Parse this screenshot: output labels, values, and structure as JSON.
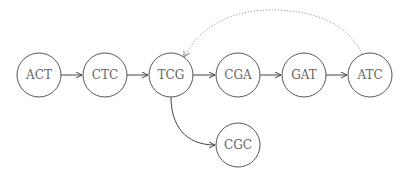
{
  "diagram": {
    "type": "directed-graph",
    "nodes": [
      {
        "id": "n1",
        "label": "ACT",
        "cx": 39,
        "cy": 75
      },
      {
        "id": "n2",
        "label": "CTC",
        "cx": 105,
        "cy": 75
      },
      {
        "id": "n3",
        "label": "TCG",
        "cx": 171,
        "cy": 75
      },
      {
        "id": "n4",
        "label": "CGA",
        "cx": 238,
        "cy": 75
      },
      {
        "id": "n5",
        "label": "GAT",
        "cx": 304,
        "cy": 75
      },
      {
        "id": "n6",
        "label": "ATC",
        "cx": 370,
        "cy": 75
      },
      {
        "id": "n7",
        "label": "CGC",
        "cx": 238,
        "cy": 145
      }
    ],
    "edges": [
      {
        "from": "ACT",
        "to": "CTC",
        "style": "solid"
      },
      {
        "from": "CTC",
        "to": "TCG",
        "style": "solid"
      },
      {
        "from": "TCG",
        "to": "CGA",
        "style": "solid"
      },
      {
        "from": "CGA",
        "to": "GAT",
        "style": "solid"
      },
      {
        "from": "GAT",
        "to": "ATC",
        "style": "solid"
      },
      {
        "from": "TCG",
        "to": "CGC",
        "style": "solid-curved"
      },
      {
        "from": "ATC",
        "to": "TCG",
        "style": "dotted-curved"
      }
    ]
  }
}
